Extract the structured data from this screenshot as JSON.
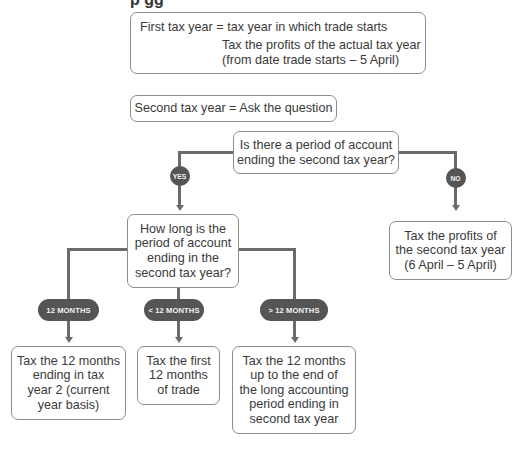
{
  "title_fragment": "p gg",
  "first_tax_year": {
    "line1": "First tax year = tax year in which trade starts",
    "line2": "Tax the profits of the actual tax year",
    "line3": "(from date trade starts – 5 April)"
  },
  "second_tax_year": {
    "label": "Second tax year = Ask the question"
  },
  "question1": {
    "lines": [
      "Is there a period of account",
      "ending the second tax year?"
    ]
  },
  "branches": {
    "yes": "YES",
    "no": "NO"
  },
  "no_result": {
    "lines": [
      "Tax the profits of",
      "the second tax year",
      "(6 April – 5 April)"
    ]
  },
  "question2": {
    "lines": [
      "How long is the",
      "period of account",
      "ending in the",
      "second tax year?"
    ]
  },
  "length_options": [
    {
      "label": "12 MONTHS",
      "result": [
        "Tax the 12 months",
        "ending in tax",
        "year 2 (current",
        "year basis)"
      ]
    },
    {
      "label": "< 12 MONTHS",
      "result": [
        "Tax the first",
        "12 months",
        "of trade"
      ]
    },
    {
      "label": "> 12 MONTHS",
      "result": [
        "Tax the 12 months",
        "up to the end of",
        "the long accounting",
        "period ending in",
        "second tax year"
      ]
    }
  ],
  "colors": {
    "box_border": "#8c8c8c",
    "connector": "#6b6b6b",
    "badge_fill": "#555555",
    "badge_text": "#f2f2f2",
    "text": "#3a3a3a"
  }
}
